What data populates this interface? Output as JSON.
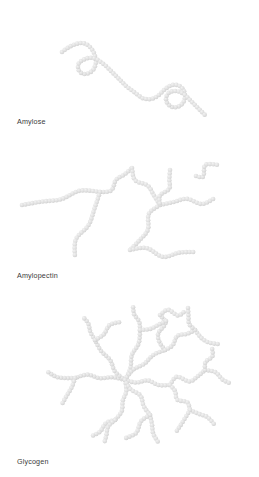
{
  "figure": {
    "background_color": "#ffffff",
    "monomer_color": "#e0e0e0",
    "monomer_highlight_color": "#f2f2f2",
    "monomer_shadow_color": "#cfcfcf",
    "label_color": "#3a3a3a",
    "width": 259,
    "height": 477
  },
  "panels": [
    {
      "id": "amylose",
      "label": "Amylose",
      "description": "Unbranched helical chain of glucose monomers with two coiled loops",
      "branching": "none",
      "monomer_count": 92
    },
    {
      "id": "amylopectin",
      "label": "Amylopectin",
      "description": "Sparsely branched chain of glucose monomers",
      "branching": "sparse",
      "monomer_count": 196
    },
    {
      "id": "glycogen",
      "label": "Glycogen",
      "description": "Densely branched cluster of glucose monomers",
      "branching": "dense",
      "monomer_count": 248
    }
  ],
  "chart_data": {
    "type": "diagram",
    "monomer_radius": 2.3,
    "monomer_spacing": 3.5,
    "paths": {
      "amylose": [
        [
          [
            62,
            52
          ],
          [
            66,
            49
          ],
          [
            71,
            46
          ],
          [
            76,
            44
          ],
          [
            81,
            43
          ],
          [
            86,
            44
          ],
          [
            90,
            47
          ],
          [
            93,
            51
          ],
          [
            95,
            56
          ],
          [
            96,
            61
          ],
          [
            95,
            66
          ],
          [
            93,
            70
          ],
          [
            89,
            73
          ],
          [
            84,
            74
          ],
          [
            80,
            72
          ],
          [
            78,
            68
          ],
          [
            79,
            63
          ],
          [
            83,
            60
          ],
          [
            88,
            58
          ],
          [
            93,
            58
          ],
          [
            98,
            60
          ],
          [
            102,
            63
          ],
          [
            106,
            66
          ],
          [
            110,
            70
          ],
          [
            114,
            74
          ],
          [
            118,
            78
          ],
          [
            122,
            82
          ],
          [
            126,
            86
          ],
          [
            130,
            89
          ],
          [
            134,
            92
          ],
          [
            138,
            95
          ],
          [
            142,
            98
          ],
          [
            146,
            99
          ],
          [
            151,
            99
          ],
          [
            156,
            97
          ],
          [
            160,
            94
          ],
          [
            164,
            90
          ],
          [
            168,
            87
          ],
          [
            172,
            85
          ],
          [
            177,
            85
          ],
          [
            181,
            87
          ],
          [
            184,
            91
          ],
          [
            185,
            96
          ],
          [
            184,
            101
          ],
          [
            181,
            105
          ],
          [
            177,
            107
          ],
          [
            172,
            107
          ],
          [
            168,
            104
          ],
          [
            166,
            100
          ],
          [
            167,
            95
          ],
          [
            170,
            92
          ],
          [
            175,
            91
          ],
          [
            180,
            92
          ],
          [
            185,
            95
          ],
          [
            189,
            99
          ],
          [
            193,
            103
          ],
          [
            197,
            107
          ],
          [
            201,
            111
          ],
          [
            205,
            115
          ]
        ]
      ],
      "amylopectin": [
        {
          "from": [
            22,
            205
          ],
          "to": [
            100,
            192
          ],
          "kind": "main"
        },
        {
          "from": [
            100,
            192
          ],
          "to": [
            132,
            168
          ],
          "kind": "branch"
        },
        {
          "from": [
            100,
            192
          ],
          "to": [
            75,
            258
          ],
          "kind": "branch"
        },
        {
          "from": [
            132,
            168
          ],
          "to": [
            160,
            205
          ],
          "kind": "branch"
        },
        {
          "from": [
            160,
            205
          ],
          "to": [
            215,
            198
          ],
          "kind": "branch"
        },
        {
          "from": [
            160,
            205
          ],
          "to": [
            130,
            250
          ],
          "kind": "branch"
        },
        {
          "from": [
            170,
            170
          ],
          "to": [
            160,
            205
          ],
          "kind": "branch"
        },
        {
          "from": [
            196,
            176
          ],
          "to": [
            218,
            165
          ],
          "kind": "branch"
        },
        {
          "from": [
            130,
            250
          ],
          "to": [
            196,
            252
          ],
          "kind": "branch"
        }
      ],
      "glycogen": [
        {
          "from": [
            125,
            380
          ],
          "to": [
            75,
            378
          ],
          "kind": "branch"
        },
        {
          "from": [
            125,
            380
          ],
          "to": [
            95,
            340
          ],
          "kind": "branch"
        },
        {
          "from": [
            125,
            380
          ],
          "to": [
            140,
            330
          ],
          "kind": "branch"
        },
        {
          "from": [
            125,
            380
          ],
          "to": [
            165,
            350
          ],
          "kind": "branch"
        },
        {
          "from": [
            125,
            380
          ],
          "to": [
            170,
            385
          ],
          "kind": "branch"
        },
        {
          "from": [
            125,
            380
          ],
          "to": [
            115,
            420
          ],
          "kind": "branch"
        },
        {
          "from": [
            125,
            380
          ],
          "to": [
            150,
            415
          ],
          "kind": "branch"
        },
        {
          "from": [
            165,
            350
          ],
          "to": [
            160,
            315
          ],
          "kind": "branch"
        },
        {
          "from": [
            165,
            350
          ],
          "to": [
            195,
            330
          ],
          "kind": "branch"
        },
        {
          "from": [
            170,
            385
          ],
          "to": [
            205,
            370
          ],
          "kind": "branch"
        },
        {
          "from": [
            170,
            385
          ],
          "to": [
            190,
            410
          ],
          "kind": "branch"
        }
      ]
    }
  }
}
